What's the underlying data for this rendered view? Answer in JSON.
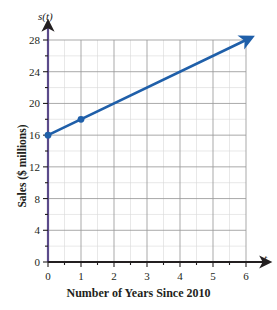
{
  "chart_data": {
    "type": "line",
    "title": "",
    "subtitle": "",
    "xlabel": "Number of Years Since 2010",
    "ylabel": "Sales ($ millions)",
    "x_axis_variable": "t",
    "y_axis_function": "s(t)",
    "xlim": [
      0,
      6
    ],
    "ylim": [
      0,
      28
    ],
    "x_ticks": [
      0,
      1,
      2,
      3,
      4,
      5,
      6
    ],
    "x_tick_labels": [
      "0",
      "1",
      "2",
      "3",
      "4",
      "5",
      "6"
    ],
    "x_minor_tick_step": 0.5,
    "y_ticks": [
      0,
      4,
      8,
      12,
      16,
      20,
      24,
      28
    ],
    "y_tick_labels": [
      "0",
      "4",
      "8",
      "12",
      "16",
      "20",
      "24",
      "28"
    ],
    "y_minor_tick_step": 2,
    "grid": true,
    "grid_major_color": "#9a9a9a",
    "grid_minor_color": "#d8d8d8",
    "legend": false,
    "legend_position": "none",
    "series": [
      {
        "name": "s(t)",
        "type": "line",
        "color": "#1f5fa9",
        "line_width": 2.6,
        "equation": "s(t) = 2t + 16",
        "slope": 2,
        "intercept": 16,
        "x": [
          0,
          6
        ],
        "values": [
          16,
          28
        ],
        "arrow_end": true,
        "markers": [
          {
            "x": 0,
            "y": 16
          },
          {
            "x": 1,
            "y": 18
          }
        ]
      }
    ],
    "axis_color": "#231f20",
    "annotations": []
  },
  "axes": {
    "x_name": "t",
    "y_name": "s(t)",
    "x_title": "Number of Years Since 2010",
    "y_title": "Sales ($ millions)"
  }
}
